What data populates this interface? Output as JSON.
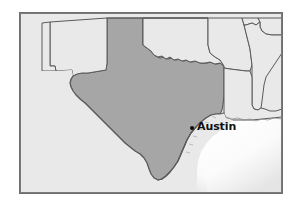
{
  "figure": {
    "type": "map",
    "region": "Texas and surrounding states, United States / northeastern Mexico",
    "frame": {
      "border_color": "#6f6f6f"
    }
  },
  "colors": {
    "highlight_fill": "#a6a6a6",
    "land_fill": "#e9e9e9",
    "water_fill": "#ffffff",
    "border_line": "#5a5a5a",
    "outer_frame": "#6f6f6f",
    "label_text": "#101010",
    "marker": "#0b0b0b"
  },
  "highlighted_state": {
    "name": "Texas",
    "fill": "#a6a6a6"
  },
  "water_bodies": [
    {
      "name": "Gulf of Mexico",
      "fill": "#ffffff"
    }
  ],
  "cities": [
    {
      "name": "Austin",
      "label": "Austin",
      "marker": "city-dot",
      "label_position": "right-of-dot",
      "in_region": "Texas"
    },
    {
      "name": "Saltillo",
      "label": "Saltillo",
      "marker": "city-dot",
      "label_position": "left-of-dot",
      "in_region": "Mexico"
    }
  ]
}
